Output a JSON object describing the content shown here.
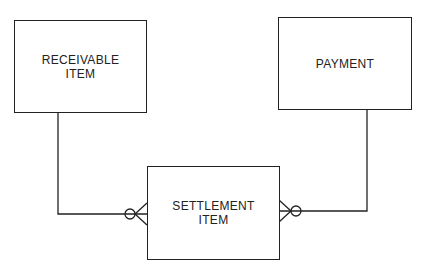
{
  "diagram": {
    "type": "entity-relationship",
    "entities": [
      {
        "id": "receivable_item",
        "label": "RECEIVABLE\nITEM"
      },
      {
        "id": "payment",
        "label": "PAYMENT"
      },
      {
        "id": "settlement_item",
        "label": "SETTLEMENT\nITEM"
      }
    ],
    "relationships": [
      {
        "from": "receivable_item",
        "to": "settlement_item",
        "cardinality": "zero-or-many"
      },
      {
        "from": "payment",
        "to": "settlement_item",
        "cardinality": "zero-or-many"
      }
    ]
  }
}
